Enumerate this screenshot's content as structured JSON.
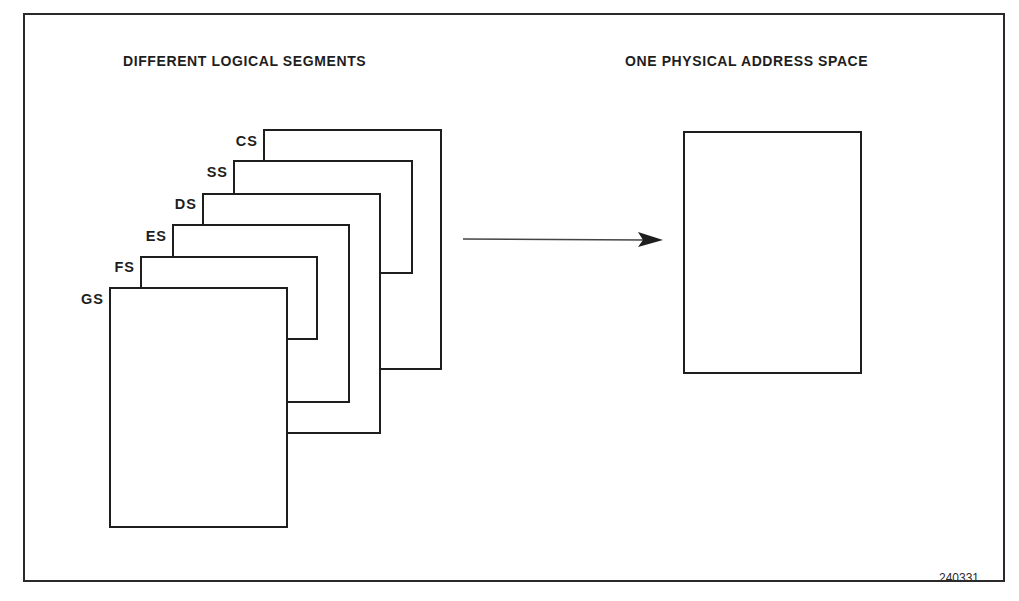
{
  "diagram": {
    "left_heading": "DIFFERENT LOGICAL SEGMENTS",
    "right_heading": "ONE PHYSICAL ADDRESS SPACE",
    "figure_number": "240331",
    "segments": [
      {
        "label": "CS",
        "left": 263,
        "top": 129,
        "right": 441,
        "bottom": 369
      },
      {
        "label": "SS",
        "left": 233,
        "top": 160,
        "right": 412,
        "bottom": 273
      },
      {
        "label": "DS",
        "left": 202,
        "top": 193,
        "right": 380,
        "bottom": 433
      },
      {
        "label": "ES",
        "left": 172,
        "top": 224,
        "right": 349,
        "bottom": 402
      },
      {
        "label": "FS",
        "left": 140,
        "top": 256,
        "right": 317,
        "bottom": 339
      },
      {
        "label": "GS",
        "left": 109,
        "top": 287,
        "right": 287,
        "bottom": 527
      }
    ],
    "physical_space": {
      "left": 683,
      "top": 131,
      "right": 861,
      "bottom": 373
    },
    "arrow": {
      "x1": 463,
      "y1": 239,
      "x2": 663,
      "y2": 240,
      "direction": "right"
    },
    "colors": {
      "stroke": "#1e1e1e",
      "background": "#ffffff"
    }
  }
}
